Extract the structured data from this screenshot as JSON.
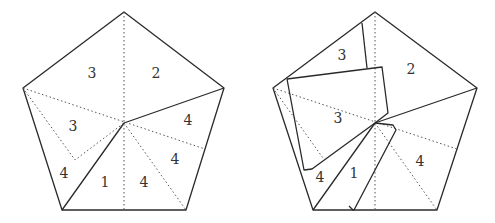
{
  "figure": {
    "left_pentagon": {
      "labels": [
        {
          "text": "3",
          "x": 92,
          "y": 74
        },
        {
          "text": "2",
          "x": 156,
          "y": 74
        },
        {
          "text": "3",
          "x": 73,
          "y": 127
        },
        {
          "text": "4",
          "x": 188,
          "y": 121
        },
        {
          "text": "4",
          "x": 175,
          "y": 160
        },
        {
          "text": "4",
          "x": 64,
          "y": 174
        },
        {
          "text": "1",
          "x": 105,
          "y": 183
        },
        {
          "text": "4",
          "x": 144,
          "y": 183
        }
      ]
    },
    "right_pentagon": {
      "labels": [
        {
          "text": "3",
          "x": 342,
          "y": 56
        },
        {
          "text": "2",
          "x": 411,
          "y": 70
        },
        {
          "text": "3",
          "x": 338,
          "y": 119
        },
        {
          "text": "4",
          "x": 420,
          "y": 162
        },
        {
          "text": "4",
          "x": 320,
          "y": 178
        },
        {
          "text": "1",
          "x": 354,
          "y": 174
        }
      ]
    }
  }
}
